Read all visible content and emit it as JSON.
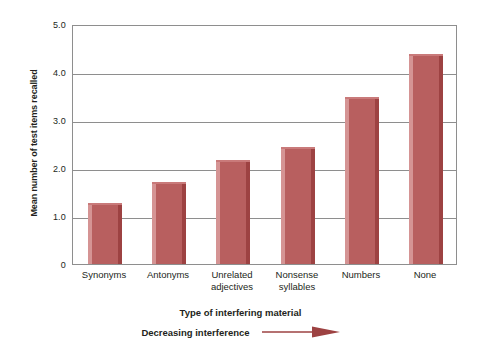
{
  "chart_data": {
    "type": "bar",
    "title": "",
    "categories": [
      "Synonyms",
      "Antonyms",
      "Unrelated adjectives",
      "Nonsense syllables",
      "Numbers",
      "None"
    ],
    "category_lines": [
      [
        "Synonyms"
      ],
      [
        "Antonyms"
      ],
      [
        "Unrelated",
        "adjectives"
      ],
      [
        "Nonsense",
        "syllables"
      ],
      [
        "Numbers"
      ],
      [
        "None"
      ]
    ],
    "values": [
      1.27,
      1.7,
      2.17,
      2.44,
      3.48,
      4.38
    ],
    "xlabel": "Type of interfering material",
    "ylabel": "Mean number of test items recalled",
    "ylim": [
      0,
      5
    ],
    "yticks": [
      5.0,
      4.0,
      3.0,
      2.0,
      1.0,
      0
    ],
    "ytick_labels": [
      "5.0",
      "4.0",
      "3.0",
      "2.0",
      "1.0",
      "0"
    ],
    "grid": true,
    "legend": "none",
    "annotation": "Decreasing interference",
    "annotation_arrow": "right-arrow-icon",
    "bar_color": "#b85f5f",
    "bar_edge_light": "#d59494",
    "bar_edge_dark": "#9d4242",
    "grid_color": "#8e8e8e",
    "text_color": "#231f20",
    "background": "#ffffff"
  }
}
